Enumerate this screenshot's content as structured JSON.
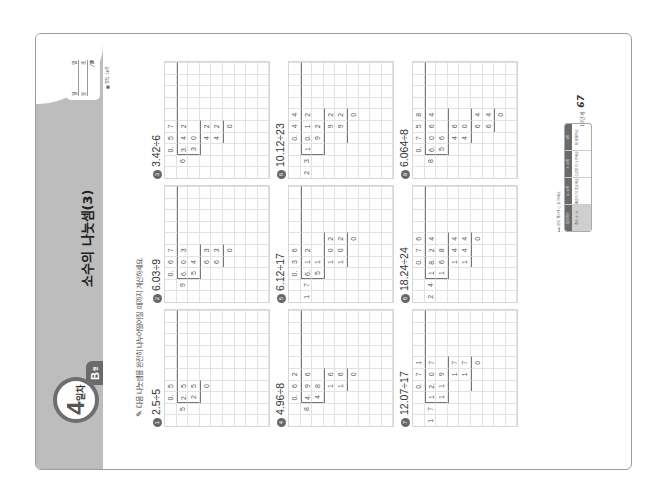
{
  "header": {
    "day_number": "4",
    "day_label": "일차",
    "type_label": "B",
    "type_suffix": "형",
    "title": "소수의 나눗셈(3)",
    "date_box": {
      "row1": [
        "월",
        "일"
      ],
      "row2": [
        "분",
        "초"
      ],
      "score": "/9"
    },
    "answer_ref": "■ 정답 26쪽"
  },
  "instruction": {
    "icon": "pencil-icon",
    "text": "다음 나눗셈을 완전히 나누어떨어질 때까지 계산하세요."
  },
  "problems": [
    {
      "num": "1",
      "label": "2.5÷5",
      "cells": [
        [
          0,
          2,
          "0."
        ],
        [
          0,
          3,
          "5"
        ],
        [
          1,
          1,
          "5"
        ],
        [
          1,
          2,
          "2."
        ],
        [
          1,
          3,
          "5"
        ],
        [
          2,
          2,
          "2"
        ],
        [
          2,
          3,
          "5"
        ],
        [
          3,
          3,
          "0"
        ]
      ],
      "bracket_col": 2,
      "bracket_rows": [
        1,
        2
      ],
      "lines": [
        [
          3,
          2,
          3
        ]
      ]
    },
    {
      "num": "2",
      "label": "6.03÷9",
      "cells": [
        [
          0,
          2,
          "0."
        ],
        [
          0,
          3,
          "6"
        ],
        [
          0,
          4,
          "7"
        ],
        [
          1,
          1,
          "9"
        ],
        [
          1,
          2,
          "6."
        ],
        [
          1,
          3,
          "0"
        ],
        [
          1,
          4,
          "3"
        ],
        [
          2,
          2,
          "5"
        ],
        [
          2,
          3,
          "4"
        ],
        [
          3,
          3,
          "6"
        ],
        [
          3,
          4,
          "3"
        ],
        [
          4,
          3,
          "6"
        ],
        [
          4,
          4,
          "3"
        ],
        [
          5,
          4,
          "0"
        ]
      ],
      "bracket_col": 2,
      "bracket_rows": [
        1,
        2
      ],
      "lines": [
        [
          3,
          2,
          4
        ],
        [
          5,
          3,
          4
        ]
      ]
    },
    {
      "num": "3",
      "label": "3.42÷6",
      "cells": [
        [
          0,
          2,
          "0."
        ],
        [
          0,
          3,
          "5"
        ],
        [
          0,
          4,
          "7"
        ],
        [
          1,
          1,
          "6"
        ],
        [
          1,
          2,
          "3."
        ],
        [
          1,
          3,
          "4"
        ],
        [
          1,
          4,
          "2"
        ],
        [
          2,
          2,
          "3"
        ],
        [
          2,
          3,
          "0"
        ],
        [
          3,
          3,
          "4"
        ],
        [
          3,
          4,
          "2"
        ],
        [
          4,
          3,
          "4"
        ],
        [
          4,
          4,
          "2"
        ],
        [
          5,
          4,
          "0"
        ]
      ],
      "bracket_col": 2,
      "bracket_rows": [
        1,
        2
      ],
      "lines": [
        [
          3,
          2,
          4
        ],
        [
          5,
          3,
          4
        ]
      ]
    },
    {
      "num": "4",
      "label": "4.96÷8",
      "cells": [
        [
          0,
          2,
          "0."
        ],
        [
          0,
          3,
          "6"
        ],
        [
          0,
          4,
          "2"
        ],
        [
          1,
          1,
          "8"
        ],
        [
          1,
          2,
          "4."
        ],
        [
          1,
          3,
          "9"
        ],
        [
          1,
          4,
          "6"
        ],
        [
          2,
          2,
          "4"
        ],
        [
          2,
          3,
          "8"
        ],
        [
          3,
          3,
          "1"
        ],
        [
          3,
          4,
          "6"
        ],
        [
          4,
          3,
          "1"
        ],
        [
          4,
          4,
          "6"
        ],
        [
          5,
          4,
          "0"
        ]
      ],
      "bracket_col": 2,
      "bracket_rows": [
        1,
        2
      ],
      "lines": [
        [
          3,
          2,
          4
        ],
        [
          5,
          3,
          4
        ]
      ]
    },
    {
      "num": "5",
      "label": "6.12÷17",
      "cells": [
        [
          0,
          2,
          "0."
        ],
        [
          0,
          3,
          "3"
        ],
        [
          0,
          4,
          "6"
        ],
        [
          1,
          0,
          "1"
        ],
        [
          1,
          1,
          "7"
        ],
        [
          1,
          2,
          "6."
        ],
        [
          1,
          3,
          "1"
        ],
        [
          1,
          4,
          "2"
        ],
        [
          2,
          2,
          "5"
        ],
        [
          2,
          3,
          "1"
        ],
        [
          3,
          3,
          "1"
        ],
        [
          3,
          4,
          "0"
        ],
        [
          3,
          5,
          "2"
        ],
        [
          4,
          3,
          "1"
        ],
        [
          4,
          4,
          "0"
        ],
        [
          4,
          5,
          "2"
        ],
        [
          5,
          5,
          "0"
        ]
      ],
      "bracket_col": 2,
      "bracket_rows": [
        1,
        2
      ],
      "lines": [
        [
          3,
          2,
          5
        ],
        [
          5,
          3,
          5
        ]
      ]
    },
    {
      "num": "6",
      "label": "10.12÷23",
      "cells": [
        [
          0,
          3,
          "0."
        ],
        [
          0,
          4,
          "4"
        ],
        [
          0,
          5,
          "4"
        ],
        [
          1,
          0,
          "2"
        ],
        [
          1,
          1,
          "3"
        ],
        [
          1,
          2,
          "1"
        ],
        [
          1,
          3,
          "0."
        ],
        [
          1,
          4,
          "1"
        ],
        [
          1,
          5,
          "2"
        ],
        [
          2,
          3,
          "9"
        ],
        [
          2,
          4,
          "2"
        ],
        [
          3,
          4,
          "9"
        ],
        [
          3,
          5,
          "2"
        ],
        [
          4,
          4,
          "9"
        ],
        [
          4,
          5,
          "2"
        ],
        [
          5,
          5,
          "0"
        ]
      ],
      "bracket_col": 2,
      "bracket_rows": [
        1,
        2
      ],
      "lines": [
        [
          3,
          2,
          5
        ],
        [
          5,
          3,
          5
        ]
      ]
    },
    {
      "num": "7",
      "label": "12.07÷17",
      "cells": [
        [
          0,
          3,
          "0."
        ],
        [
          0,
          4,
          "7"
        ],
        [
          0,
          5,
          "1"
        ],
        [
          1,
          0,
          "1"
        ],
        [
          1,
          1,
          "7"
        ],
        [
          1,
          2,
          "1"
        ],
        [
          1,
          3,
          "2."
        ],
        [
          1,
          4,
          "0"
        ],
        [
          1,
          5,
          "7"
        ],
        [
          2,
          2,
          "1"
        ],
        [
          2,
          3,
          "1"
        ],
        [
          2,
          4,
          "9"
        ],
        [
          3,
          4,
          "1"
        ],
        [
          3,
          5,
          "7"
        ],
        [
          4,
          4,
          "1"
        ],
        [
          4,
          5,
          "7"
        ],
        [
          5,
          5,
          "0"
        ]
      ],
      "bracket_col": 2,
      "bracket_rows": [
        1,
        2
      ],
      "lines": [
        [
          3,
          2,
          5
        ],
        [
          5,
          3,
          5
        ]
      ]
    },
    {
      "num": "8",
      "label": "18.24÷24",
      "cells": [
        [
          0,
          3,
          "0."
        ],
        [
          0,
          4,
          "7"
        ],
        [
          0,
          5,
          "6"
        ],
        [
          1,
          0,
          "2"
        ],
        [
          1,
          1,
          "4"
        ],
        [
          1,
          2,
          "1"
        ],
        [
          1,
          3,
          "8."
        ],
        [
          1,
          4,
          "2"
        ],
        [
          1,
          5,
          "4"
        ],
        [
          2,
          2,
          "1"
        ],
        [
          2,
          3,
          "6"
        ],
        [
          2,
          4,
          "8"
        ],
        [
          3,
          3,
          "1"
        ],
        [
          3,
          4,
          "4"
        ],
        [
          3,
          5,
          "4"
        ],
        [
          4,
          3,
          "1"
        ],
        [
          4,
          4,
          "4"
        ],
        [
          4,
          5,
          "4"
        ],
        [
          5,
          5,
          "0"
        ]
      ],
      "bracket_col": 2,
      "bracket_rows": [
        1,
        2
      ],
      "lines": [
        [
          3,
          2,
          5
        ],
        [
          5,
          3,
          5
        ]
      ]
    },
    {
      "num": "9",
      "label": "6.064÷8",
      "cells": [
        [
          0,
          2,
          "0."
        ],
        [
          0,
          3,
          "7"
        ],
        [
          0,
          4,
          "5"
        ],
        [
          0,
          5,
          "8"
        ],
        [
          1,
          1,
          "8"
        ],
        [
          1,
          2,
          "6."
        ],
        [
          1,
          3,
          "0"
        ],
        [
          1,
          4,
          "6"
        ],
        [
          1,
          5,
          "4"
        ],
        [
          2,
          2,
          "5"
        ],
        [
          2,
          3,
          "6"
        ],
        [
          3,
          3,
          "4"
        ],
        [
          3,
          4,
          "6"
        ],
        [
          4,
          3,
          "4"
        ],
        [
          4,
          4,
          "0"
        ],
        [
          5,
          4,
          "6"
        ],
        [
          5,
          5,
          "4"
        ],
        [
          6,
          4,
          "6"
        ],
        [
          6,
          5,
          "4"
        ],
        [
          7,
          5,
          "0"
        ]
      ],
      "bracket_col": 2,
      "bracket_rows": [
        1,
        2
      ],
      "lines": [
        [
          3,
          2,
          5
        ],
        [
          5,
          3,
          5
        ],
        [
          7,
          4,
          5
        ]
      ]
    }
  ],
  "footer": {
    "selfcheck_note": "▸▸▸ 맞힌 개수에 ○표 하세요.",
    "selfcheck_columns": [
      {
        "head": "맞힌 개수",
        "body": "개수 0~4"
      },
      {
        "head": "5~6개",
        "body": "예습이 더 필요해요"
      },
      {
        "head": "7~8개",
        "body": "조금만 더 노력해요"
      },
      {
        "head": "9개",
        "body": "참 잘했어요"
      }
    ],
    "step_label": "10단계",
    "page_number": "67"
  }
}
